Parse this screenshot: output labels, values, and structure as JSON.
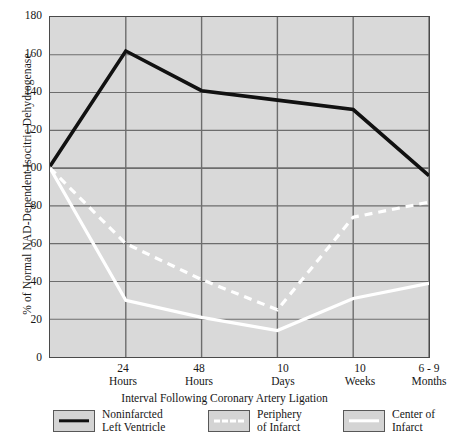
{
  "chart_data": {
    "type": "line",
    "title": "",
    "xlabel": "Interval Following Coronary Artery Ligation",
    "ylabel": "% of Normal NAD-Dependent Isocitric Dehydrogenase",
    "categories": [
      "Control",
      "24 Hours",
      "48 Hours",
      "10 Days",
      "10 Weeks",
      "6-9 Months"
    ],
    "x_tick_labels": [
      {
        "line1": "24",
        "line2": "Hours"
      },
      {
        "line1": "48",
        "line2": "Hours"
      },
      {
        "line1": "10",
        "line2": "Days"
      },
      {
        "line1": "10",
        "line2": "Weeks"
      },
      {
        "line1": "6 - 9",
        "line2": "Months"
      }
    ],
    "y_tick_labels": [
      "0",
      "20",
      "40",
      "60",
      "80",
      "100",
      "120",
      "140",
      "160",
      "180"
    ],
    "ylim": [
      0,
      180
    ],
    "ytick_step": 20,
    "grid": true,
    "legend_position": "bottom",
    "series": [
      {
        "name": "Noninfarcted Left Ventricle",
        "style": "solid",
        "color": "#111111",
        "values": [
          101,
          162,
          141,
          136,
          131,
          96
        ]
      },
      {
        "name": "Periphery of Infarct",
        "style": "dashed",
        "color": "#ffffff",
        "values": [
          100,
          60,
          41,
          25,
          74,
          82
        ]
      },
      {
        "name": "Center of Infarct",
        "style": "solid",
        "color": "#ffffff",
        "values": [
          100,
          30,
          21,
          14,
          31,
          39
        ]
      }
    ],
    "legend": [
      {
        "label_line1": "Noninfarcted",
        "label_line2": "Left Ventricle",
        "swatch": "solid-black"
      },
      {
        "label_line1": "Periphery",
        "label_line2": "of Infarct",
        "swatch": "dashed-white"
      },
      {
        "label_line1": "Center of",
        "label_line2": "Infarct",
        "swatch": "solid-white"
      }
    ],
    "colors": {
      "plot_background": "#d9d9d9",
      "grid": "#6d6d6d",
      "axis": "#4a4a4a",
      "page_background": "#ffffff",
      "text": "#161616"
    }
  }
}
